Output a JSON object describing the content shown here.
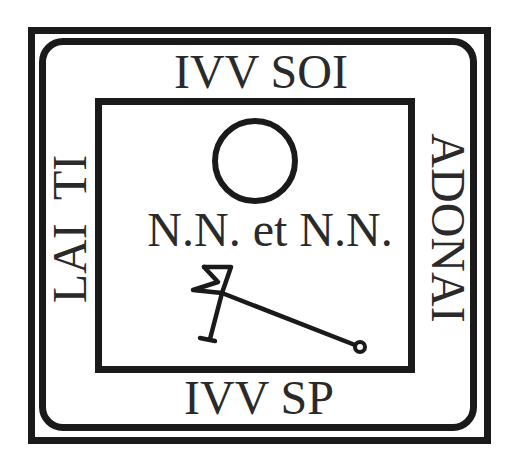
{
  "diagram": {
    "top_label": "IVV SOI",
    "bottom_label": "IVV SP",
    "left_label": "LAI  TI",
    "right_label": "ADONAI",
    "center_label": "N.N. et N.N.",
    "symbols": {
      "circle": "circle-symbol",
      "sigil": "sigil-symbol"
    },
    "colors": {
      "ink": "#1a1a1a",
      "background": "#ffffff"
    }
  }
}
